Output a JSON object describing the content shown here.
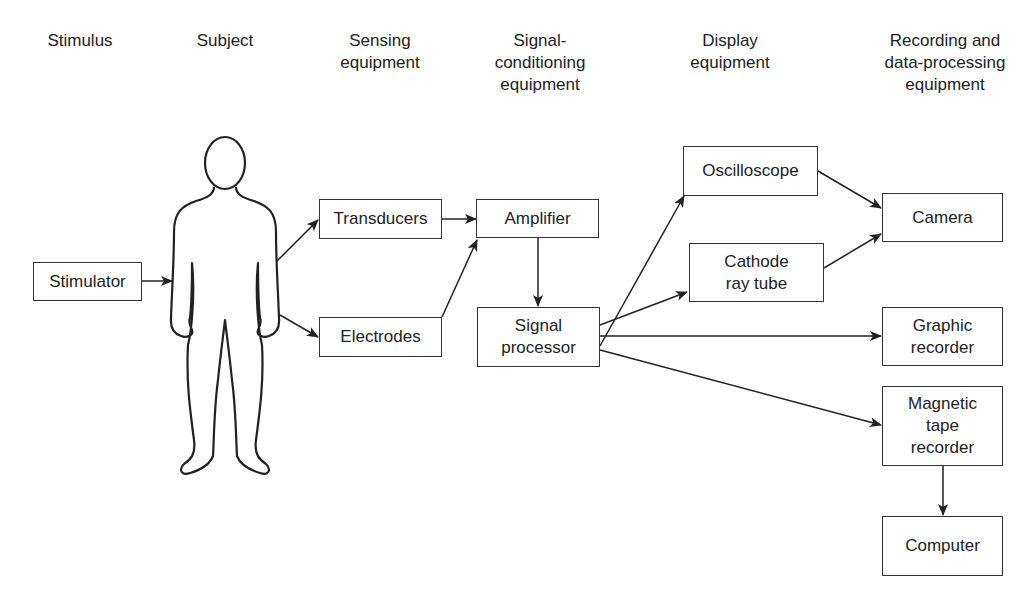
{
  "columns": [
    {
      "label": "Stimulus"
    },
    {
      "label": "Subject"
    },
    {
      "label": "Sensing\nequipment"
    },
    {
      "label": "Signal-\nconditioning\nequipment"
    },
    {
      "label": "Display\nequipment"
    },
    {
      "label": "Recording and\ndata-processing\nequipment"
    }
  ],
  "boxes": {
    "stimulator": "Stimulator",
    "transducers": "Transducers",
    "electrodes": "Electrodes",
    "amplifier": "Amplifier",
    "signal_processor": "Signal\nprocessor",
    "oscilloscope": "Oscilloscope",
    "crt": "Cathode\nray tube",
    "camera": "Camera",
    "graphic_recorder": "Graphic\nrecorder",
    "tape_recorder": "Magnetic\ntape\nrecorder",
    "computer": "Computer"
  },
  "edges": [
    [
      "Stimulator",
      "Subject"
    ],
    [
      "Subject",
      "Transducers"
    ],
    [
      "Subject",
      "Electrodes"
    ],
    [
      "Transducers",
      "Amplifier"
    ],
    [
      "Electrodes",
      "Amplifier"
    ],
    [
      "Amplifier",
      "Signal processor"
    ],
    [
      "Signal processor",
      "Oscilloscope"
    ],
    [
      "Signal processor",
      "Cathode ray tube"
    ],
    [
      "Signal processor",
      "Graphic recorder"
    ],
    [
      "Signal processor",
      "Magnetic tape recorder"
    ],
    [
      "Oscilloscope",
      "Camera"
    ],
    [
      "Cathode ray tube",
      "Camera"
    ],
    [
      "Magnetic tape recorder",
      "Computer"
    ]
  ]
}
